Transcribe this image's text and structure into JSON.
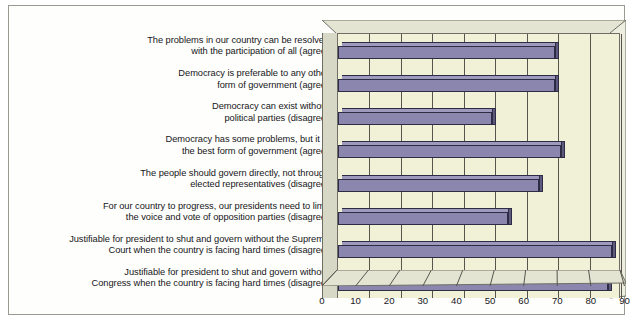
{
  "chart_data": {
    "type": "bar",
    "orientation": "horizontal",
    "title": "",
    "subtitle": "",
    "xlabel": "",
    "ylabel": "",
    "xlim": [
      0,
      90
    ],
    "xticks": [
      0,
      10,
      20,
      30,
      40,
      50,
      60,
      70,
      80,
      90
    ],
    "grid": true,
    "legend": null,
    "style": "3d-bar",
    "categories": [
      "The problems in our country can be resolved with the participation of all (agree)",
      "Democracy is preferable to any other form of government (agree)",
      "Democracy can exist without political parties (disagree)",
      "Democracy has some problems, but it is the best form of government (agree)",
      "The people should govern directly, not through elected representatives (disagree)",
      "For our country to progress, our presidents need to limit the voice and vote of opposition parties (disagree)",
      "Justifiable for president to shut and govern without the Supreme Court when the country is facing hard times (disagree)",
      "Justifiable for president to shut and govern without Congress when the country is facing hard times (disagree)"
    ],
    "values": [
      69,
      69,
      49,
      71,
      64,
      54,
      87,
      86
    ],
    "colors": {
      "bar_fill": "#8b86ad",
      "bar_top": "#9e9abd",
      "bar_cap": "#5e5a7e",
      "bar_outline": "#2e2b45",
      "plot_background": "#f1f1d7",
      "sidewall": "#d8d8c6",
      "gridline": "#55554e",
      "text": "#16161a",
      "frame_border": "#9a9a92"
    }
  },
  "category_labels": [
    {
      "line1": "The problems in our country can be resolved",
      "line2": "with the participation of all (agree)"
    },
    {
      "line1": "Democracy is preferable to any other",
      "line2": "form of government (agree)"
    },
    {
      "line1": "Democracy can exist without",
      "line2": "political parties (disagree)"
    },
    {
      "line1": "Democracy has some problems, but it is",
      "line2": "the best form of government (agree)"
    },
    {
      "line1": "The people should govern directly, not through",
      "line2": "elected representatives (disagree)"
    },
    {
      "line1": "For our country to progress, our presidents need to limit",
      "line2": "the voice and vote of opposition parties (disagree)"
    },
    {
      "line1": "Justifiable for president to shut and govern without the Supreme",
      "line2": "Court when the country is facing hard times (disagree)"
    },
    {
      "line1": "Justifiable for president to shut and govern without",
      "line2": "Congress when the country is facing hard times (disagree)"
    }
  ],
  "axis": {
    "tick_labels": [
      "0",
      "10",
      "20",
      "30",
      "40",
      "50",
      "60",
      "70",
      "80",
      "90"
    ]
  }
}
